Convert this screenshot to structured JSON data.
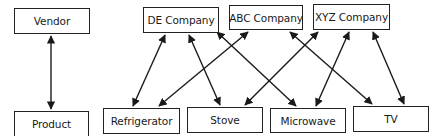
{
  "diagram": {
    "type": "entity-relationship",
    "colors": {
      "line": "#1a1a1a",
      "box_border": "#222222",
      "background": "#ffffff"
    },
    "nodes": {
      "vendor": {
        "label": "Vendor",
        "x": 14,
        "y": 8,
        "w": 76,
        "h": 26
      },
      "product": {
        "label": "Product",
        "x": 14,
        "y": 111,
        "w": 75,
        "h": 26
      },
      "de_company": {
        "label": "DE Company",
        "x": 143,
        "y": 7,
        "w": 76,
        "h": 26
      },
      "abc_company": {
        "label": "ABC Company",
        "x": 229,
        "y": 5,
        "w": 74,
        "h": 25
      },
      "xyz_company": {
        "label": "XYZ Company",
        "x": 313,
        "y": 4,
        "w": 77,
        "h": 26
      },
      "refrigerator": {
        "label": "Refrigerator",
        "x": 103,
        "y": 108,
        "w": 77,
        "h": 26
      },
      "stove": {
        "label": "Stove",
        "x": 187,
        "y": 107,
        "w": 76,
        "h": 26
      },
      "microwave": {
        "label": "Microwave",
        "x": 270,
        "y": 108,
        "w": 76,
        "h": 25
      },
      "tv": {
        "label": "TV",
        "x": 353,
        "y": 106,
        "w": 76,
        "h": 26
      }
    },
    "edges": [
      {
        "from": "vendor",
        "to": "product",
        "direction": "both"
      },
      {
        "from": "de_company",
        "to": "refrigerator",
        "direction": "both"
      },
      {
        "from": "de_company",
        "to": "stove",
        "direction": "both"
      },
      {
        "from": "de_company",
        "to": "microwave",
        "direction": "both"
      },
      {
        "from": "abc_company",
        "to": "refrigerator",
        "direction": "both"
      },
      {
        "from": "abc_company",
        "to": "tv",
        "direction": "both"
      },
      {
        "from": "xyz_company",
        "to": "stove",
        "direction": "both"
      },
      {
        "from": "xyz_company",
        "to": "microwave",
        "direction": "both"
      },
      {
        "from": "xyz_company",
        "to": "tv",
        "direction": "both"
      }
    ]
  }
}
